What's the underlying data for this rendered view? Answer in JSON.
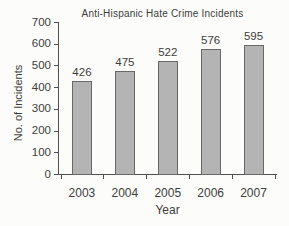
{
  "chart_data": {
    "type": "bar",
    "title": "Anti-Hispanic Hate Crime Incidents",
    "xlabel": "Year",
    "ylabel": "No. of Incidents",
    "categories": [
      "2003",
      "2004",
      "2005",
      "2006",
      "2007"
    ],
    "values": [
      426,
      475,
      522,
      576,
      595
    ],
    "data_labels": [
      "426",
      "475",
      "522",
      "576",
      "595"
    ],
    "ylim": [
      0,
      700
    ],
    "ytick_step": 100,
    "ytick_labels": [
      "0",
      "100",
      "200",
      "300",
      "400",
      "500",
      "600",
      "700"
    ],
    "grid": false,
    "legend": "none",
    "colors": {
      "bar_fill": "#b4b4b4",
      "bar_border": "#686868",
      "axis": "#4f4f4f",
      "text": "#3c3c3c",
      "background": "#fcfcfa"
    }
  }
}
